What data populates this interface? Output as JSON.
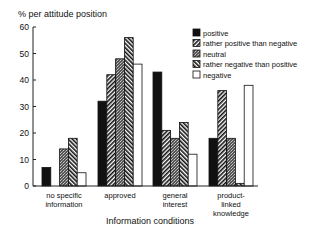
{
  "chart_data": {
    "type": "bar",
    "title": "",
    "ylabel": "% per attitude position",
    "xlabel": "Information conditions",
    "ylim": [
      0,
      60
    ],
    "yticks": [
      0,
      10,
      20,
      30,
      40,
      50,
      60
    ],
    "ytick_labels": [
      "0",
      "10",
      "20",
      "30",
      "40",
      "50",
      "60"
    ],
    "grid": false,
    "legend_position": "top-right",
    "categories": [
      [
        "no specific",
        "information"
      ],
      [
        "approved"
      ],
      [
        "general",
        "interest"
      ],
      [
        "product-",
        "linked",
        "knowledge"
      ]
    ],
    "series": [
      {
        "name": "positive",
        "pattern": "solid-black",
        "values": [
          7,
          32,
          43,
          18
        ]
      },
      {
        "name": "rather positive than negative",
        "pattern": "hatch-forward",
        "values": [
          0,
          42,
          21,
          36
        ]
      },
      {
        "name": "neutral",
        "pattern": "stipple",
        "values": [
          14,
          48,
          18,
          18
        ]
      },
      {
        "name": "rather negative than positive",
        "pattern": "hatch-backward",
        "values": [
          18,
          56,
          24,
          1
        ]
      },
      {
        "name": "negative",
        "pattern": "white",
        "values": [
          5,
          46,
          12,
          38
        ]
      }
    ]
  }
}
